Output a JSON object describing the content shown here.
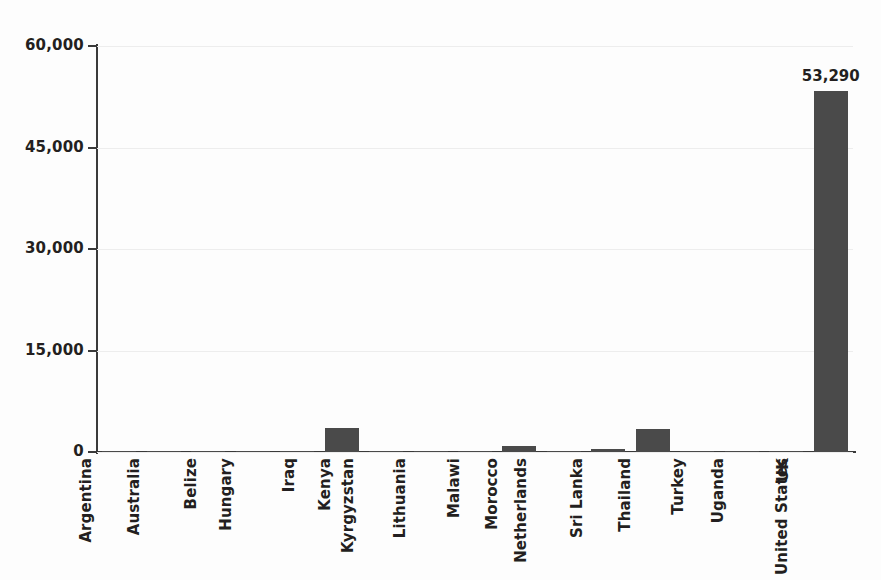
{
  "chart_data": {
    "type": "bar",
    "title": "",
    "subtitle": "",
    "xlabel": "",
    "ylabel": "",
    "ylim": [
      0,
      60000
    ],
    "ytick_labels": [
      "60,000",
      "45,000",
      "30,000",
      "15,000",
      "0"
    ],
    "ytick_values": [
      60000,
      45000,
      30000,
      15000,
      0
    ],
    "grid": true,
    "legend": null,
    "bar_color": "#4a4a4a",
    "categories": [
      "Argentina",
      "Australia",
      "Belize",
      "Hungary",
      "Iraq",
      "Kenya",
      "Kyrgyzstan",
      "Lithuania",
      "Malawi",
      "Morocco",
      "Netherlands",
      "Sri Lanka",
      "Thailand",
      "Turkey",
      "Uganda",
      "UK",
      "United States"
    ],
    "values": [
      60,
      60,
      60,
      60,
      120,
      3500,
      160,
      90,
      90,
      900,
      80,
      400,
      3400,
      90,
      80,
      80,
      53290
    ],
    "data_labels": [
      "",
      "",
      "",
      "",
      "",
      "",
      "",
      "",
      "",
      "",
      "",
      "",
      "",
      "",
      "",
      "",
      "53,290"
    ]
  }
}
